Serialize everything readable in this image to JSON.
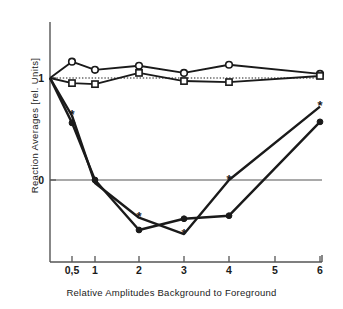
{
  "chart_data": {
    "type": "line",
    "title": "",
    "xlabel": "Relative Amplitudes Background to Foreground",
    "ylabel": "Reaction Averages  [rel. Units]",
    "x_tick_labels": [
      "0,5",
      "1",
      "2",
      "3",
      "4",
      "5",
      "6"
    ],
    "x_tick_values": [
      0.5,
      1,
      2,
      3,
      4,
      5,
      6
    ],
    "y_tick_labels": [
      "1",
      "0"
    ],
    "y_tick_values": [
      1,
      0
    ],
    "ylim": [
      -0.75,
      1.3
    ],
    "grid": false,
    "legend": "none",
    "reference_lines": [
      {
        "name": "zero-line",
        "y": 0,
        "style": "solid"
      },
      {
        "name": "unity-line",
        "y": 1,
        "style": "dotted"
      }
    ],
    "series": [
      {
        "name": "open-circle-series",
        "marker": "open-circle",
        "x": [
          0,
          0.5,
          1,
          2,
          3,
          4,
          6
        ],
        "values": [
          1.0,
          1.16,
          1.08,
          1.12,
          1.05,
          1.13,
          1.04
        ]
      },
      {
        "name": "open-square-series",
        "marker": "open-square",
        "x": [
          0,
          0.5,
          1,
          2,
          3,
          4,
          6
        ],
        "values": [
          1.0,
          0.95,
          0.94,
          1.05,
          0.97,
          0.96,
          1.02
        ]
      },
      {
        "name": "filled-circle-series",
        "marker": "filled-circle",
        "x": [
          0,
          0.5,
          1,
          2,
          3,
          4,
          6
        ],
        "values": [
          1.0,
          0.56,
          0.0,
          -0.49,
          -0.38,
          -0.35,
          0.57
        ]
      },
      {
        "name": "asterisk-series",
        "marker": "asterisk",
        "x": [
          0,
          0.5,
          1,
          2,
          3,
          4,
          6
        ],
        "values": [
          1.0,
          0.63,
          -0.03,
          -0.37,
          -0.53,
          0.0,
          0.72
        ]
      }
    ],
    "colors": {
      "line": "#1a1a1a",
      "marker_fill": "#ffffff",
      "axis": "#555555",
      "background": "#ffffff"
    }
  }
}
